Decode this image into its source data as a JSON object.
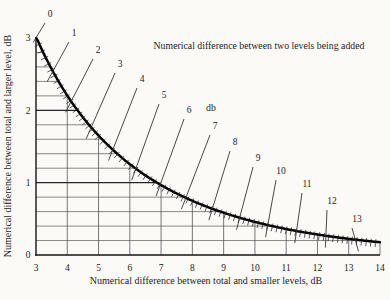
{
  "figure": {
    "background": "#fbfaf7",
    "ink": "#1c1c1c",
    "curve_color": "#000000",
    "grid_minor_color": "#565656",
    "grid_major_color": "#262626",
    "pointer_color": "#333333"
  },
  "chart_data": {
    "type": "line",
    "title": "Numerical difference between two levels being added",
    "xlabel": "Numerical difference between total and smaller levels, dB",
    "ylabel": "Numerical difference between total and larger level, dB",
    "xlim": [
      3,
      14
    ],
    "ylim": [
      0,
      3
    ],
    "x_ticks": [
      3,
      4,
      5,
      6,
      7,
      8,
      9,
      10,
      11,
      12,
      13,
      14
    ],
    "y_ticks": [
      0,
      1,
      2,
      3
    ],
    "y_minor_step": 0.2,
    "grid": true,
    "legend_position": "none",
    "curve_formula": "y = -10*log10(1 - 10^(-x/10))  (decibel addition curve)",
    "curve_points": [
      {
        "x": 3.01,
        "y": 3.01
      },
      {
        "x": 4,
        "y": 2.2
      },
      {
        "x": 5,
        "y": 1.65
      },
      {
        "x": 6,
        "y": 1.26
      },
      {
        "x": 7,
        "y": 0.97
      },
      {
        "x": 8,
        "y": 0.75
      },
      {
        "x": 9,
        "y": 0.58
      },
      {
        "x": 10,
        "y": 0.46
      },
      {
        "x": 11,
        "y": 0.36
      },
      {
        "x": 12,
        "y": 0.28
      },
      {
        "x": 13,
        "y": 0.22
      },
      {
        "x": 14,
        "y": 0.18
      }
    ],
    "unit_label": {
      "text": "db",
      "pos_px": [
        210,
        108
      ]
    },
    "diagonals": [
      {
        "value": "0",
        "curve_x": 3.01,
        "curve_y": 3.01,
        "label_px": [
          50,
          14
        ]
      },
      {
        "value": "1",
        "curve_x": 3.54,
        "curve_y": 2.54,
        "label_px": [
          74,
          33
        ]
      },
      {
        "value": "2",
        "curve_x": 4.12,
        "curve_y": 2.12,
        "label_px": [
          98,
          50
        ]
      },
      {
        "value": "3",
        "curve_x": 4.76,
        "curve_y": 1.76,
        "label_px": [
          120,
          64
        ]
      },
      {
        "value": "4",
        "curve_x": 5.46,
        "curve_y": 1.46,
        "label_px": [
          142,
          79
        ]
      },
      {
        "value": "5",
        "curve_x": 6.19,
        "curve_y": 1.19,
        "label_px": [
          164,
          95
        ]
      },
      {
        "value": "6",
        "curve_x": 6.97,
        "curve_y": 0.97,
        "label_px": [
          189,
          110
        ]
      },
      {
        "value": "7",
        "curve_x": 7.79,
        "curve_y": 0.79,
        "label_px": [
          215,
          126
        ]
      },
      {
        "value": "8",
        "curve_x": 8.64,
        "curve_y": 0.64,
        "label_px": [
          235,
          142
        ]
      },
      {
        "value": "9",
        "curve_x": 9.51,
        "curve_y": 0.51,
        "label_px": [
          258,
          158
        ]
      },
      {
        "value": "10",
        "curve_x": 10.41,
        "curve_y": 0.41,
        "label_px": [
          281,
          171
        ]
      },
      {
        "value": "11",
        "curve_x": 11.33,
        "curve_y": 0.33,
        "label_px": [
          307,
          184
        ]
      },
      {
        "value": "12",
        "curve_x": 12.27,
        "curve_y": 0.27,
        "label_px": [
          332,
          201
        ]
      },
      {
        "value": "13",
        "curve_x": 13.21,
        "curve_y": 0.21,
        "label_px": [
          357,
          219
        ]
      }
    ]
  }
}
